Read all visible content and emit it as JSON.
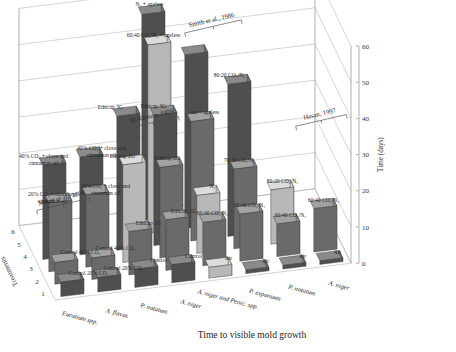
{
  "chart": {
    "title": "Time to visible mold growth",
    "value_axis_label": "Time (days)",
    "depth_axis_label": "Treatments",
    "depth_ticks": [
      "1",
      "2",
      "3",
      "4",
      "5",
      "6"
    ],
    "value_ticks": [
      "0",
      "10",
      "20",
      "30",
      "40",
      "50",
      "60"
    ],
    "categories": [
      "Eurotium spp.",
      "A. flavus",
      "P. notatum",
      "A. niger",
      "A. niger and Penic. spp.",
      "P. expansum",
      "P. notatum",
      "A. niger"
    ],
    "study_groups": [
      {
        "name": "Matan et al., 2006"
      },
      {
        "name": "El-Khoury, 1999"
      },
      {
        "name": "Smith et al., 1986"
      },
      {
        "name": "Hasan, 1997"
      }
    ]
  },
  "chart_data": {
    "type": "bar",
    "title": "Time to visible mold growth",
    "xlabel": "",
    "ylabel": "Time (days)",
    "zlabel": "Treatments",
    "ylim": [
      0,
      60
    ],
    "yticks": [
      0,
      10,
      20,
      30,
      40,
      50,
      60
    ],
    "grid": true,
    "legend": "none",
    "categories": [
      "Eurotium spp.",
      "A. flavus",
      "P. notatum",
      "A. niger",
      "A. niger and Penic. spp.",
      "P. expansum",
      "P. notatum",
      "A. niger"
    ],
    "annotations": [
      "Matan et al., 2006",
      "El-Khoury, 1999",
      "Smith et al., 1986",
      "Hasan, 1997"
    ],
    "bars": [
      {
        "cat": 0,
        "treatment": 1,
        "value": 4,
        "label": "Control 20% CO2",
        "label_text": "Control 20% CO₂",
        "group": "Matan et al., 2006",
        "shade": "dark"
      },
      {
        "cat": 0,
        "treatment": 2,
        "value": 6,
        "label": "Control 40% CO2",
        "label_text": "Control 40% CO₂",
        "group": "Matan et al., 2006",
        "shade": "mid"
      },
      {
        "cat": 0,
        "treatment": 3,
        "value": 19,
        "label": "20% CO2 + clove and cinnamon oil",
        "label_text": "20% CO₂ + clove and cinnamon oil",
        "group": "Matan et al., 2006",
        "shade": "mid"
      },
      {
        "cat": 0,
        "treatment": 4,
        "value": 26,
        "label": "40% CO2 + clove and cinnamon oil",
        "label_text": "40% CO₂ + clove and cinnamon oil",
        "group": "Matan et al., 2006",
        "shade": "dark"
      },
      {
        "cat": 1,
        "treatment": 1,
        "value": 4,
        "label": "Control 20% CO2",
        "label_text": "Control 20% CO₂",
        "group": "Matan et al., 2006",
        "shade": "dark"
      },
      {
        "cat": 1,
        "treatment": 2,
        "value": 6,
        "label": "Control 40% CO2",
        "label_text": "Control 40% CO₂",
        "group": "Matan et al., 2006",
        "shade": "mid"
      },
      {
        "cat": 1,
        "treatment": 3,
        "value": 20,
        "label": "20% CO2 + clove and cinnamon oil",
        "label_text": "20% CO₂ + clove and cinnamon oil",
        "group": "Matan et al., 2006",
        "shade": "mid"
      },
      {
        "cat": 1,
        "treatment": 4,
        "value": 27,
        "label": "40% CO2 + clove and cinnamon oil",
        "label_text": "40% CO₂ + clove and cinnamon oil",
        "group": "Matan et al., 2006",
        "shade": "dark"
      },
      {
        "cat": 2,
        "treatment": 1,
        "value": 5,
        "label": "Control",
        "label_text": "Control",
        "group": "El-Khoury, 1999",
        "shade": "dark"
      },
      {
        "cat": 2,
        "treatment": 2,
        "value": 12,
        "label": "Ethicap 1G",
        "label_text": "Ethicap 1G",
        "group": "El-Khoury, 1999",
        "shade": "mid"
      },
      {
        "cat": 2,
        "treatment": 3,
        "value": 27,
        "label": "Ethicap 2G",
        "label_text": "Ethicap 2G",
        "group": "El-Khoury, 1999",
        "shade": "light"
      },
      {
        "cat": 2,
        "treatment": 4,
        "value": 37,
        "label": "Ethicap 3G",
        "label_text": "Ethicap 3G",
        "group": "El-Khoury, 1999",
        "shade": "dark"
      },
      {
        "cat": 3,
        "treatment": 1,
        "value": 5,
        "label": "Control",
        "label_text": "Control",
        "group": "El-Khoury, 1999",
        "shade": "dark"
      },
      {
        "cat": 3,
        "treatment": 2,
        "value": 14,
        "label": "Ethicap 1G",
        "label_text": "Ethicap 1G",
        "group": "El-Khoury, 1999",
        "shade": "mid"
      },
      {
        "cat": 3,
        "treatment": 3,
        "value": 25,
        "label": "Ethicap 2G",
        "label_text": "Ethicap 2G",
        "group": "El-Khoury, 1999",
        "shade": "mid"
      },
      {
        "cat": 3,
        "treatment": 4,
        "value": 36,
        "label": "Ethicap 3G",
        "label_text": "Ethicap 3G",
        "group": "El-Khoury, 1999",
        "shade": "dark"
      },
      {
        "cat": 3,
        "treatment": 5,
        "value": 52,
        "label": "60:40 CO2/N2 + ageless",
        "label_text": "60:40 CO₂/N₂ + ageless",
        "group": "Smith et al., 1986",
        "shade": "light"
      },
      {
        "cat": 3,
        "treatment": 6,
        "value": 57,
        "label": "N2 + ageless",
        "label_text": "N₂ + ageless",
        "group": "Smith et al., 1986",
        "shade": "dark"
      },
      {
        "cat": 4,
        "treatment": 1,
        "value": 3,
        "label": "Air",
        "label_text": "Air",
        "group": "Smith et al., 1986",
        "shade": "light"
      },
      {
        "cat": 4,
        "treatment": 2,
        "value": 12,
        "label": "60:40 CO2/N2",
        "label_text": "60:40 CO₂/N₂",
        "group": "Smith et al., 1986",
        "shade": "mid"
      },
      {
        "cat": 4,
        "treatment": 3,
        "value": 16,
        "label": "N2",
        "label_text": "N₂",
        "group": "Smith et al., 1986",
        "shade": "light"
      },
      {
        "cat": 4,
        "treatment": 4,
        "value": 33,
        "label": "Air + ageless",
        "label_text": "Air + ageless",
        "group": "Smith et al., 1986",
        "shade": "mid"
      },
      {
        "cat": 4,
        "treatment": 5,
        "value": 48,
        "label": "60:40 CO2/N2 + ageless",
        "label_text": "60:40 CO₂/N₂ + ageless",
        "group": "Smith et al., 1986",
        "shade": "dark"
      },
      {
        "cat": 5,
        "treatment": 1,
        "value": 1,
        "label": "Air",
        "label_text": "Air",
        "group": "Hasan, 1997",
        "shade": "dark"
      },
      {
        "cat": 5,
        "treatment": 2,
        "value": 13,
        "label": "60:40 CO2/N2",
        "label_text": "60:40 CO₂/N₂",
        "group": "Hasan, 1997",
        "shade": "mid"
      },
      {
        "cat": 5,
        "treatment": 3,
        "value": 22,
        "label": "70:30 CO2/N2",
        "label_text": "70:30 CO₂/N₂",
        "group": "Hasan, 1997",
        "shade": "mid"
      },
      {
        "cat": 5,
        "treatment": 4,
        "value": 42,
        "label": "80:20 CO2/N2",
        "label_text": "80:20 CO₂/N₂",
        "group": "Hasan, 1997",
        "shade": "dark"
      },
      {
        "cat": 6,
        "treatment": 1,
        "value": 1,
        "label": "Air",
        "label_text": "Air",
        "group": "Hasan, 1997",
        "shade": "dark"
      },
      {
        "cat": 6,
        "treatment": 2,
        "value": 9,
        "label": "60:40 CO2/N2",
        "label_text": "60:40 CO₂/N₂",
        "group": "Hasan, 1997",
        "shade": "mid"
      },
      {
        "cat": 6,
        "treatment": 3,
        "value": 15,
        "label": "80:20 CO2/N2",
        "label_text": "80:20 CO₂/N₂",
        "group": "Hasan, 1997",
        "shade": "light"
      },
      {
        "cat": 7,
        "treatment": 1,
        "value": 1,
        "label": "Air",
        "label_text": "Air",
        "group": "Hasan, 1997",
        "shade": "dark"
      },
      {
        "cat": 7,
        "treatment": 2,
        "value": 12,
        "label": "60:40 CO2/N2",
        "label_text": "60:40 CO₂/N₂",
        "group": "Hasan, 1997",
        "shade": "mid"
      }
    ]
  },
  "bar_labels": {
    "b0": "Control 20% CO₂",
    "b1": "Control 40% CO₂",
    "b2": "20% CO₂ + clove and",
    "b2b": "cinnamon oil",
    "b3": "40% CO₂ + clove and",
    "b3b": "cinnamon oil",
    "b4": "Control 20% CO₂",
    "b5": "Control 40% CO₂",
    "b6": "20% CO₂ + clove and",
    "b6b": "cinnamon oil",
    "b7": "40% CO₂ + clove and",
    "b7b": "cinnamon oil",
    "b8": "Control",
    "b9": "Ethicap 1G",
    "b10": "Ethicap 2G",
    "b11": "Ethicap 3G",
    "b12": "Control",
    "b13": "Ethicap 1G",
    "b14": "Ethicap 2G",
    "b15": "Ethicap 3G",
    "b16": "60:40 CO₂/N₂ + ageless",
    "b17": "N₂ + ageless",
    "b18": "Air",
    "b19": "60:40 CO₂/N₂",
    "b20": "N₂",
    "b21": "Air + ageless",
    "b22": "Air",
    "b23": "60:40 CO₂/N₂",
    "b24": "70:30 CO₂/N₂",
    "b25": "80:20 CO₂/N₂",
    "b26": "Air",
    "b27": "60:40 CO₂/N₂",
    "b28": "80:20 CO₂/N₂",
    "b29": "Air",
    "b30": "60:40 CO₂/N₂"
  },
  "colors": {
    "bar_dark_front": "#4f4f4f",
    "bar_dark_side": "#6e6e6e",
    "bar_dark_top": "#8a8a8a",
    "bar_mid_front": "#6a6a6a",
    "bar_mid_side": "#888888",
    "bar_mid_top": "#a2a2a2",
    "bar_light_front": "#b8b8b8",
    "bar_light_side": "#cfcfcf",
    "bar_light_top": "#dcdcdc",
    "grid": "#b9b9b9",
    "frame": "#8e8e8e",
    "text": "#262626",
    "background": "#ffffff"
  }
}
